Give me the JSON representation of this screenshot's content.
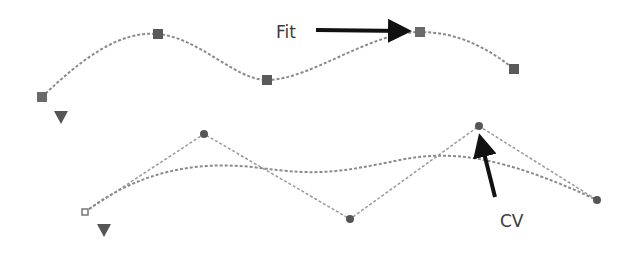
{
  "labels": {
    "fit": "Fit",
    "cv": "CV"
  },
  "colors": {
    "curve": "#8a8a8a",
    "point": "#5a5a5a",
    "arrow": "#111111",
    "text": "#3a3a3a"
  },
  "fit_curve": {
    "edit_points": [
      [
        42,
        97
      ],
      [
        158,
        34
      ],
      [
        267,
        80
      ],
      [
        420,
        32
      ],
      [
        514,
        69
      ]
    ],
    "start_triangle": [
      61,
      117
    ]
  },
  "cv_curve": {
    "cvs": [
      [
        85,
        212
      ],
      [
        204,
        134
      ],
      [
        350,
        219
      ],
      [
        479,
        126
      ],
      [
        597,
        200
      ]
    ],
    "start_triangle": [
      104,
      228
    ]
  }
}
